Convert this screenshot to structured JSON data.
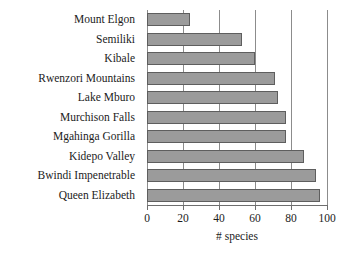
{
  "chart_data": {
    "type": "bar",
    "orientation": "horizontal",
    "title": "",
    "xlabel": "# species",
    "ylabel": "",
    "categories": [
      "Mount Elgon",
      "Semiliki",
      "Kibale",
      "Rwenzori Mountains",
      "Lake Mburo",
      "Murchison Falls",
      "Mgahinga Gorilla",
      "Kidepo Valley",
      "Bwindi Impenetrable",
      "Queen Elizabeth"
    ],
    "values": [
      24,
      53,
      60,
      71,
      73,
      77,
      77,
      87,
      94,
      96
    ],
    "xlim": [
      0,
      100
    ],
    "xticks": [
      0,
      20,
      40,
      60,
      80,
      100
    ],
    "xticklabels": [
      "0",
      "20",
      "40",
      "60",
      "80",
      "100"
    ],
    "grid": "vertical",
    "legend": null,
    "colors": {
      "bar_fill": "#9b9b9b",
      "bar_edge": "#5e5e5e",
      "gridline": "#8c8c8c",
      "axis": "#6e6e6e",
      "text": "#1b1b1b",
      "background": "#ffffff"
    }
  }
}
